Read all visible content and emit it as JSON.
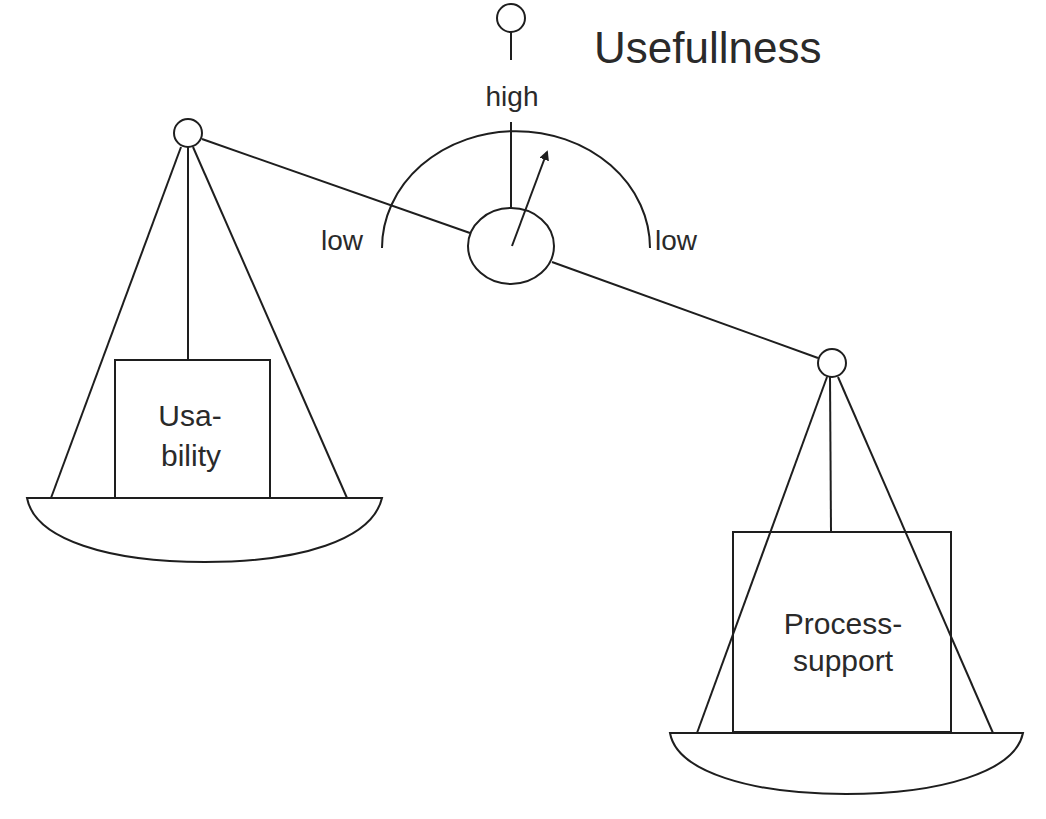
{
  "diagram": {
    "title": "Usefullness",
    "gauge": {
      "top_label": "high",
      "left_label": "low",
      "right_label": "low"
    },
    "left_pan": {
      "box_line1": "Usa-",
      "box_line2": "bility"
    },
    "right_pan": {
      "box_line1": "Process-",
      "box_line2": "support"
    },
    "colors": {
      "stroke": "#1e1e1e",
      "text": "#2a2a2a",
      "background": "#ffffff"
    }
  }
}
